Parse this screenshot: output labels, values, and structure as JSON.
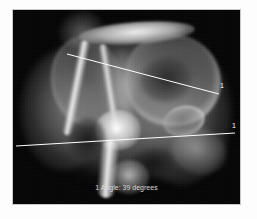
{
  "viewer": {
    "name": "radiograph-measurement-viewer",
    "background_color": "#ffffff",
    "plate_color": "#050505",
    "frame_color": "#c9c9c9"
  },
  "image": {
    "modality": "radiograph",
    "anatomy_description": "pelvis hip joint radiograph",
    "alt_text": "Grayscale X-ray of a hip joint with two overlaid angle measurement lines"
  },
  "overlay": {
    "line_color": "#ffffff",
    "label_color": "#ffffff",
    "lines": [
      {
        "id": "line-a",
        "label": "1",
        "x1": 54,
        "y1": 44,
        "x2": 206,
        "y2": 84
      },
      {
        "id": "line-b",
        "label": "1",
        "x1": 3,
        "y1": 136,
        "x2": 222,
        "y2": 123
      }
    ],
    "labels": [
      {
        "id": "measure-label-line-a",
        "text": "1"
      },
      {
        "id": "measure-label-line-b",
        "text": "1"
      }
    ],
    "caption": "1 Angle: 39 degrees",
    "caption_color": "#d8d8d8"
  },
  "measurement": {
    "index": "1",
    "quantity": "Angle",
    "value": "39",
    "unit": "degrees"
  }
}
